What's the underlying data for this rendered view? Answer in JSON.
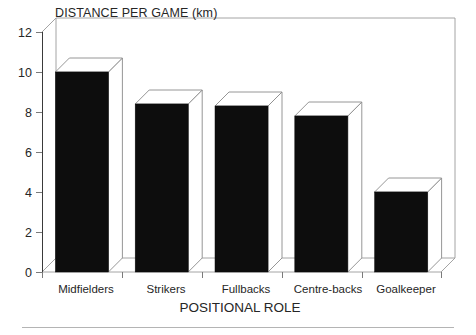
{
  "chart_data": {
    "type": "bar",
    "title": "DISTANCE PER GAME (km)",
    "xlabel": "POSITIONAL ROLE",
    "ylabel": "",
    "categories": [
      "Midfielders",
      "Strikers",
      "Fullbacks",
      "Centre-backs",
      "Goalkeeper"
    ],
    "values": [
      10.0,
      8.4,
      8.3,
      7.8,
      4.0
    ],
    "ylim": [
      0,
      12
    ],
    "yticks": [
      0,
      2,
      4,
      6,
      8,
      10,
      12
    ],
    "ytick_labels": [
      "0",
      "2",
      "4",
      "6",
      "8",
      "10",
      "12"
    ],
    "grid": false,
    "legend": "none",
    "style": "3d-extruded-bars",
    "colors": {
      "bar_face": "#0d0d0d",
      "bar_top": "#ffffff",
      "bar_side": "#ffffff",
      "bar_edge": "#8a8a8a",
      "axis": "#3a3a3a",
      "frame": "#9a9a9a",
      "text": "#262626",
      "background": "#ffffff",
      "rule": "#b4b4b4"
    }
  },
  "figure": {
    "title": "DISTANCE PER GAME (km)",
    "axis_titles": {
      "x": "POSITIONAL ROLE"
    },
    "y_tick_labels": [
      "12",
      "10",
      "8",
      "6",
      "4",
      "2",
      "0"
    ],
    "x_tick_labels": [
      "Midfielders",
      "Strikers",
      "Fullbacks",
      "Centre-backs",
      "Goalkeeper"
    ]
  }
}
